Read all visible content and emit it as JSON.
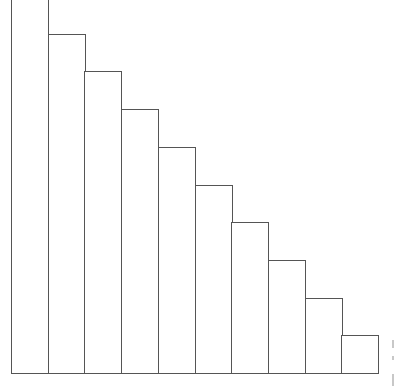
{
  "chart_data": {
    "type": "bar",
    "title": "",
    "xlabel": "",
    "ylabel": "",
    "categories": [
      "1",
      "2",
      "3",
      "4",
      "5",
      "6",
      "7",
      "8",
      "9",
      "10"
    ],
    "values": [
      10,
      9,
      8,
      7,
      6,
      5,
      4,
      3,
      2,
      1
    ],
    "ylim": [
      0,
      9.9
    ],
    "grid": false,
    "legend": null,
    "bar_fill": "#ffffff",
    "bar_edge": "#555555"
  },
  "layout": {
    "plot_left": 11,
    "bar_width": 36.7,
    "baseline_y": 373,
    "px_per_unit": 37.7
  }
}
